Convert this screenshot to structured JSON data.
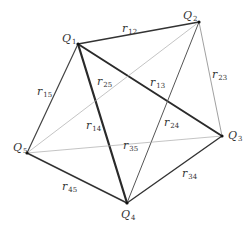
{
  "diagram": {
    "title": "",
    "nodes": [
      {
        "id": "Q1",
        "letter": "Q",
        "sub": "1",
        "x": 78,
        "y": 44,
        "lx": 62,
        "ly": 42
      },
      {
        "id": "Q2",
        "letter": "Q",
        "sub": "2",
        "x": 199,
        "y": 22,
        "lx": 183,
        "ly": 19
      },
      {
        "id": "Q3",
        "letter": "Q",
        "sub": "3",
        "x": 222,
        "y": 136,
        "lx": 228,
        "ly": 139
      },
      {
        "id": "Q4",
        "letter": "Q",
        "sub": "4",
        "x": 127,
        "y": 203,
        "lx": 121,
        "ly": 218
      },
      {
        "id": "Q5",
        "letter": "Q",
        "sub": "5",
        "x": 27,
        "y": 153,
        "lx": 13,
        "ly": 151
      }
    ],
    "edges": [
      {
        "from": "Q1",
        "to": "Q2",
        "label": "r",
        "sub": "12",
        "lx": 122,
        "ly": 32,
        "color": "#333333",
        "width": 1.4
      },
      {
        "from": "Q1",
        "to": "Q3",
        "label": "r",
        "sub": "13",
        "lx": 150,
        "ly": 86,
        "color": "#2a2a2a",
        "width": 2.0
      },
      {
        "from": "Q1",
        "to": "Q4",
        "label": "r",
        "sub": "14",
        "lx": 86,
        "ly": 129,
        "color": "#2a2a2a",
        "width": 2.2
      },
      {
        "from": "Q1",
        "to": "Q5",
        "label": "r",
        "sub": "15",
        "lx": 37,
        "ly": 95,
        "color": "#444444",
        "width": 1.2
      },
      {
        "from": "Q2",
        "to": "Q3",
        "label": "r",
        "sub": "23",
        "lx": 212,
        "ly": 78,
        "color": "#888888",
        "width": 0.8
      },
      {
        "from": "Q2",
        "to": "Q4",
        "label": "r",
        "sub": "24",
        "lx": 164,
        "ly": 126,
        "color": "#555555",
        "width": 1.0
      },
      {
        "from": "Q2",
        "to": "Q5",
        "label": "r",
        "sub": "25",
        "lx": 97,
        "ly": 85,
        "color": "#aaaaaa",
        "width": 0.7
      },
      {
        "from": "Q3",
        "to": "Q4",
        "label": "r",
        "sub": "34",
        "lx": 182,
        "ly": 177,
        "color": "#333333",
        "width": 1.4
      },
      {
        "from": "Q3",
        "to": "Q5",
        "label": "r",
        "sub": "35",
        "lx": 123,
        "ly": 149,
        "color": "#aaaaaa",
        "width": 0.7
      },
      {
        "from": "Q4",
        "to": "Q5",
        "label": "r",
        "sub": "45",
        "lx": 62,
        "ly": 190,
        "color": "#333333",
        "width": 1.5
      }
    ]
  }
}
